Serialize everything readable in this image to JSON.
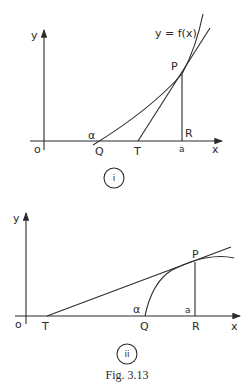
{
  "figure": {
    "caption": "Fig. 3.13",
    "panel_i": {
      "marker": "i",
      "axis_x_label": "x",
      "axis_y_label": "y",
      "origin_label": "o",
      "curve_label": "y = f(x)",
      "points": {
        "P": "P",
        "Q": "Q",
        "T": "T",
        "R": "R"
      },
      "angle_label": "α",
      "foot_label": "a"
    },
    "panel_ii": {
      "marker": "ii",
      "axis_x_label": "x",
      "axis_y_label": "y",
      "origin_label": "o",
      "points": {
        "P": "P",
        "Q": "Q",
        "T": "T",
        "R": "R"
      },
      "angle_label": "α",
      "foot_label": "a"
    },
    "colors": {
      "ink": "#2a2a2a",
      "paper": "#ffffff"
    }
  }
}
